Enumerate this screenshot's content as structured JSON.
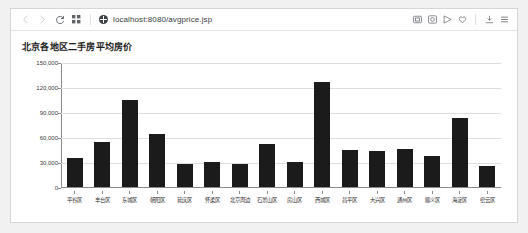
{
  "browser": {
    "url": "localhost:8080/avgprice.jsp",
    "nav": {
      "back_label": "‹",
      "forward_label": "›",
      "reload_label": "C",
      "apps_label": "∷"
    },
    "left_icons": [
      {
        "name": "back-icon",
        "glyph": "‹"
      },
      {
        "name": "forward-icon",
        "glyph": "›"
      },
      {
        "name": "reload-icon",
        "glyph": "C"
      },
      {
        "name": "apps-grid-icon",
        "glyph": "∷"
      }
    ],
    "site_icon": "globe-icon",
    "right_icons": [
      {
        "name": "screenshot-icon"
      },
      {
        "name": "collections-icon"
      },
      {
        "name": "send-icon"
      },
      {
        "name": "favorite-heart-icon"
      },
      {
        "name": "downloads-icon"
      },
      {
        "name": "menu-icon"
      }
    ]
  },
  "chart_data": {
    "type": "bar",
    "title": "北京各地区二手房平均房价",
    "xlabel": "",
    "ylabel": "",
    "ylim": [
      0,
      150000
    ],
    "ytick_values": [
      0,
      30000,
      60000,
      90000,
      120000,
      150000
    ],
    "ytick_labels": [
      "0",
      "30,000",
      "60,000",
      "90,000",
      "120,000",
      "150,000"
    ],
    "grid": true,
    "legend": false,
    "bar_color": "#1b1b1b",
    "categories": [
      "平谷区",
      "丰台区",
      "东城区",
      "朝阳区",
      "延庆区",
      "怀柔区",
      "北京周边",
      "石景山区",
      "房山区",
      "西城区",
      "昌平区",
      "大兴区",
      "通州区",
      "顺义区",
      "海淀区",
      "密云区"
    ],
    "values": [
      35000,
      54000,
      105000,
      64000,
      28000,
      30000,
      28000,
      52000,
      30000,
      127000,
      45000,
      43000,
      46000,
      37000,
      84000,
      25000
    ]
  }
}
